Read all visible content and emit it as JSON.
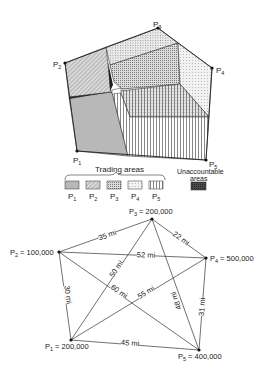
{
  "top_diagram": {
    "points": [
      {
        "id": "P1",
        "label": "P",
        "sub": "1",
        "x": 77,
        "y": 151
      },
      {
        "id": "P2",
        "label": "P",
        "sub": "2",
        "x": 65,
        "y": 63
      },
      {
        "id": "P3",
        "label": "P",
        "sub": "3",
        "x": 158,
        "y": 28
      },
      {
        "id": "P4",
        "label": "P",
        "sub": "4",
        "x": 212,
        "y": 68
      },
      {
        "id": "P5",
        "label": "P",
        "sub": "5",
        "x": 206,
        "y": 160
      }
    ],
    "legend": {
      "group_title": "Trading areas",
      "items": [
        {
          "label": "P",
          "sub": "1",
          "pattern": "solid-gray"
        },
        {
          "label": "P",
          "sub": "2",
          "pattern": "diagonal-hatch"
        },
        {
          "label": "P",
          "sub": "3",
          "pattern": "dense-dots"
        },
        {
          "label": "P",
          "sub": "4",
          "pattern": "light-dots"
        },
        {
          "label": "P",
          "sub": "5",
          "pattern": "vertical-lines"
        }
      ],
      "unaccountable_title_1": "Unaccountable",
      "unaccountable_title_2": "areas",
      "unaccountable_pattern": "dark-cross-hatch"
    }
  },
  "bottom_diagram": {
    "nodes": [
      {
        "id": "P1",
        "label": "P",
        "sub": "1",
        "value": "= 200,000",
        "x": 71,
        "y": 340
      },
      {
        "id": "P2",
        "label": "P",
        "sub": "2",
        "value": "= 100,000",
        "x": 59,
        "y": 252
      },
      {
        "id": "P3",
        "label": "P",
        "sub": "3",
        "value": "= 200,000",
        "x": 152,
        "y": 219
      },
      {
        "id": "P4",
        "label": "P",
        "sub": "4",
        "value": "= 500,000",
        "x": 206,
        "y": 258
      },
      {
        "id": "P5",
        "label": "P",
        "sub": "5",
        "value": "= 400,000",
        "x": 199,
        "y": 350
      }
    ],
    "edges": [
      {
        "from": "P2",
        "to": "P3",
        "label": "35 mi"
      },
      {
        "from": "P3",
        "to": "P4",
        "label": "22 mi"
      },
      {
        "from": "P2",
        "to": "P4",
        "label": "52 mi"
      },
      {
        "from": "P1",
        "to": "P3",
        "label": "50 mi"
      },
      {
        "from": "P2",
        "to": "P5",
        "label": "60 mi"
      },
      {
        "from": "P1",
        "to": "P4",
        "label": "55 mi"
      },
      {
        "from": "P3",
        "to": "P5",
        "label": "48 mi"
      },
      {
        "from": "P4",
        "to": "P5",
        "label": "31 mi"
      },
      {
        "from": "P1",
        "to": "P2",
        "label": "30 mi"
      },
      {
        "from": "P1",
        "to": "P5",
        "label": "45 mi"
      }
    ]
  }
}
